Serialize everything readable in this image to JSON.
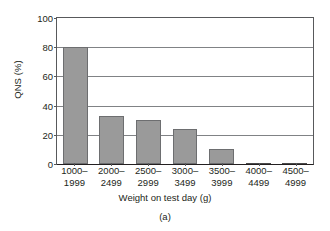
{
  "chart_data": {
    "type": "bar",
    "title": "",
    "categories": [
      "1000-1999",
      "2000-2499",
      "2500-2999",
      "3000-3499",
      "3500-3999",
      "4000-4499",
      "4500-4999"
    ],
    "category_lines": [
      [
        "1000–",
        "1999"
      ],
      [
        "2000–",
        "2499"
      ],
      [
        "2500–",
        "2999"
      ],
      [
        "3000–",
        "3499"
      ],
      [
        "3500–",
        "3999"
      ],
      [
        "4000–",
        "4499"
      ],
      [
        "4500–",
        "4999"
      ]
    ],
    "values": [
      80,
      33,
      30,
      24,
      10,
      0.5,
      0.5
    ],
    "xlabel": "Weight on test day (g)",
    "ylabel": "QNS (%)",
    "ylim": [
      0,
      100
    ],
    "yticks": [
      0,
      20,
      40,
      60,
      80,
      100
    ],
    "ytick_labels": [
      "0",
      "20",
      "40",
      "60",
      "80",
      "100"
    ],
    "grid": true,
    "legend": false,
    "caption": "(a)",
    "bar_color": "#9a9a9a",
    "bar_edge_color": "#6d6e70",
    "gridline_color": "#808285",
    "axis_color": "#231f20"
  }
}
